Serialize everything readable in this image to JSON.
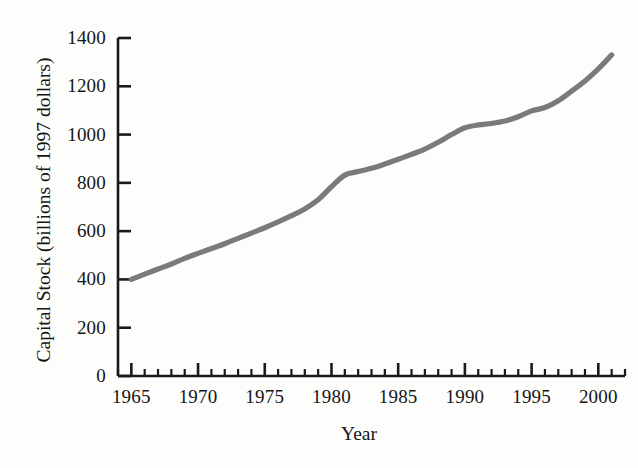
{
  "chart_data": {
    "type": "line",
    "title": "",
    "xlabel": "Year",
    "ylabel": "Capital Stock (billions of 1997 dollars)",
    "xlim": [
      1964,
      2002
    ],
    "ylim": [
      0,
      1400
    ],
    "grid": false,
    "legend": "none",
    "line_color": "#7a7a7a",
    "axis_color": "#1a1a1a",
    "x_ticks": [
      1965,
      1970,
      1975,
      1980,
      1985,
      1990,
      1995,
      2000
    ],
    "x_tick_labels": [
      "1965",
      "1970",
      "1975",
      "1980",
      "1985",
      "1990",
      "1995",
      "2000"
    ],
    "x_minor_tick_interval": 1,
    "y_ticks": [
      0,
      200,
      400,
      600,
      800,
      1000,
      1200,
      1400
    ],
    "y_tick_labels": [
      "0",
      "200",
      "400",
      "600",
      "800",
      "1000",
      "1200",
      "1400"
    ],
    "series": [
      {
        "name": "Capital Stock",
        "x": [
          1965,
          1966,
          1967,
          1968,
          1969,
          1970,
          1971,
          1972,
          1973,
          1974,
          1975,
          1976,
          1977,
          1978,
          1979,
          1980,
          1981,
          1982,
          1983,
          1984,
          1985,
          1986,
          1987,
          1988,
          1989,
          1990,
          1991,
          1992,
          1993,
          1994,
          1995,
          1996,
          1997,
          1998,
          1999,
          2000,
          2001
        ],
        "y": [
          400,
          422,
          443,
          464,
          487,
          508,
          528,
          548,
          570,
          592,
          614,
          638,
          664,
          692,
          730,
          784,
          832,
          847,
          860,
          878,
          898,
          918,
          940,
          968,
          1000,
          1028,
          1040,
          1046,
          1056,
          1074,
          1098,
          1112,
          1140,
          1180,
          1222,
          1272,
          1330
        ]
      }
    ]
  },
  "axes": {
    "y_title": "Capital Stock (billions of 1997 dollars)",
    "x_title": "Year"
  }
}
